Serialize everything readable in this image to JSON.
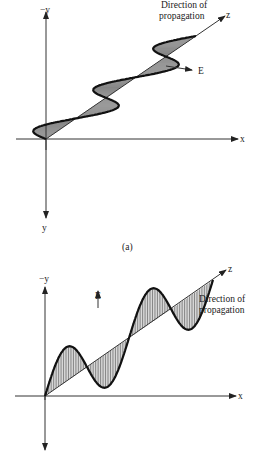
{
  "figure_a": {
    "caption": "(a)",
    "labels": {
      "neg_y": "−y",
      "y": "y",
      "x": "x",
      "z": "z",
      "field": "E",
      "direction_line1": "Direction of",
      "direction_line2": "propagation"
    },
    "polarization": "horizontal (E along x)"
  },
  "figure_b": {
    "labels": {
      "neg_y": "−y",
      "x": "x",
      "z": "z",
      "field": "E",
      "direction_line1": "Direction of",
      "direction_line2": "propagation"
    },
    "polarization": "vertical (E along −y)"
  },
  "colors": {
    "ink": "#111111",
    "background": "#ffffff"
  }
}
